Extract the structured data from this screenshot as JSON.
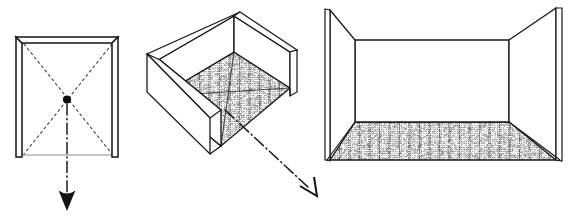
{
  "figure": {
    "title": "Room construction sequence: plan, axonometric, perspective",
    "background_color": "#ffffff",
    "ink_color": "#1a1a1a",
    "width": 573,
    "height": 219,
    "medium": "hand-drawn pencil/ink sketch",
    "panel_count": 3
  },
  "panels": [
    {
      "id": "plan",
      "name": "plan-view",
      "label": "Plan view of room with diagonals",
      "description": "Square room plan drawn with three thick double-line walls (left, top, right) and an open bottom side shown as a thin light line. Two dashed diagonals run corner to corner and cross at a solid black centre dot.",
      "projection": "orthographic plan",
      "bounds": {
        "x": 16,
        "y": 37,
        "width": 102,
        "height": 121
      },
      "wall_count": 3,
      "open_side": "bottom",
      "diagonals": 2,
      "diagonal_style": "dashed",
      "center_marker": "solid-dot",
      "floor_texture": "none"
    },
    {
      "id": "axonometric",
      "name": "axonometric-view",
      "label": "Axonometric open box of the same room",
      "description": "The plan tilted into an axonometric open-topped box seen from above and to the left. Three walls are visible with drawn thickness and the floor inside carries a heavy mottled grey texture crossed by the two projected diagonals.",
      "projection": "axonometric",
      "bounds": {
        "x": 143,
        "y": 6,
        "width": 148,
        "height": 152
      },
      "wall_count": 3,
      "open_side": "front-right",
      "diagonals": 2,
      "diagonal_style": "solid-faint",
      "center_marker": "none",
      "floor_texture": "mottled-grey"
    },
    {
      "id": "perspective",
      "name": "perspective-view",
      "label": "One-point perspective interior of the room",
      "description": "The room seen from inside in one-point perspective: a rectangular back wall with two side walls splaying forward toward the viewer and a trapezoidal textured floor widening to the front edge.",
      "projection": "one-point perspective",
      "bounds": {
        "x": 325,
        "y": 8,
        "width": 240,
        "height": 152
      },
      "wall_count": 3,
      "open_side": "front",
      "diagonals": 0,
      "diagonal_style": "none",
      "center_marker": "none",
      "floor_texture": "mottled-grey"
    }
  ],
  "arrows": [
    {
      "id": "arrow-plan-down",
      "name": "plan-transition-arrow",
      "label": "Downward transition arrow below the plan",
      "style": "dash-dot",
      "direction": "down",
      "from_panel": "plan",
      "head": "solid-barbed",
      "start": {
        "x": 67,
        "y": 106
      },
      "end": {
        "x": 67,
        "y": 210
      }
    },
    {
      "id": "arrow-axono-downright",
      "name": "axonometric-transition-arrow",
      "label": "Down-right transition arrow from the axonometric box",
      "style": "dash-dot",
      "direction": "down-right",
      "from_panel": "axonometric",
      "head": "open-v",
      "start": {
        "x": 225,
        "y": 110
      },
      "end": {
        "x": 317,
        "y": 196
      }
    }
  ],
  "captions": []
}
